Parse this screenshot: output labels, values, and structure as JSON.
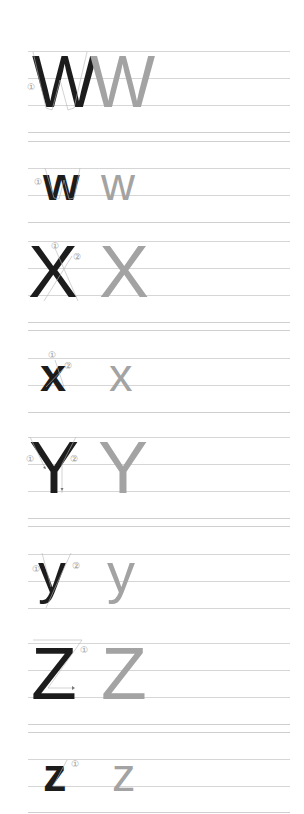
{
  "worksheet": {
    "type": "letter-tracing-practice",
    "colors": {
      "model_letter": "#1c1c1c",
      "trace_letter": "#a3a3a3",
      "guideline": "#d6d6d6",
      "stroke_number": "#9a9a9a"
    },
    "rows": [
      {
        "letter": "W",
        "case": "upper",
        "model": "W",
        "trace": "W",
        "stroke_numbers": [
          "①"
        ]
      },
      {
        "letter": "w",
        "case": "lower",
        "model": "w",
        "trace": "w",
        "stroke_numbers": [
          "①"
        ]
      },
      {
        "letter": "X",
        "case": "upper",
        "model": "X",
        "trace": "X",
        "stroke_numbers": [
          "①",
          "②"
        ]
      },
      {
        "letter": "x",
        "case": "lower",
        "model": "x",
        "trace": "x",
        "stroke_numbers": [
          "①",
          "②"
        ]
      },
      {
        "letter": "Y",
        "case": "upper",
        "model": "Y",
        "trace": "Y",
        "stroke_numbers": [
          "①",
          "②"
        ]
      },
      {
        "letter": "y",
        "case": "lower",
        "model": "y",
        "trace": "y",
        "stroke_numbers": [
          "①",
          "②"
        ]
      },
      {
        "letter": "Z",
        "case": "upper",
        "model": "Z",
        "trace": "Z",
        "stroke_numbers": [
          "①"
        ]
      },
      {
        "letter": "z",
        "case": "lower",
        "model": "z",
        "trace": "z",
        "stroke_numbers": [
          "①"
        ]
      }
    ]
  }
}
